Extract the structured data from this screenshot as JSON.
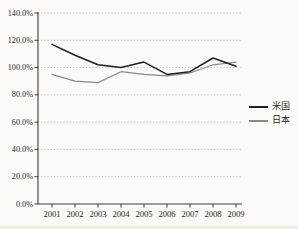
{
  "colors": {
    "background": "#fbfaf7",
    "axis": "#3d3d3d",
    "grid": "#a3a39e",
    "text": "#262626"
  },
  "chart_data": {
    "type": "line",
    "title": "",
    "xlabel": "",
    "ylabel": "",
    "x_labels": [
      "2001",
      "2002",
      "2003",
      "2004",
      "2005",
      "2006",
      "2007",
      "2008",
      "2009"
    ],
    "y_tick_labels": [
      "0.0%",
      "20.0%",
      "40.0%",
      "60.0%",
      "80.0%",
      "100.0%",
      "120.0%",
      "140.0%"
    ],
    "ylim": [
      0,
      140
    ],
    "y_tick_step": 20,
    "grid": "horizontal-dotted",
    "legend_position": "right-middle",
    "series": [
      {
        "name": "米国",
        "color": "#1f1f1f",
        "values": [
          117,
          109,
          102,
          100,
          104,
          95,
          97,
          107,
          101
        ]
      },
      {
        "name": "日本",
        "color": "#8a8a8a",
        "values": [
          95,
          90,
          89,
          97,
          95,
          94,
          96,
          102,
          104
        ]
      }
    ]
  }
}
